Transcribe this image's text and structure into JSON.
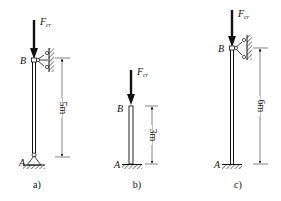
{
  "diagrams": [
    {
      "id": "a",
      "caption": "a)",
      "load_label": "F",
      "load_subscript": "cr",
      "top_point": "B",
      "bottom_point": "A",
      "length_label": "5m",
      "top_support": "lateral pin (wall)",
      "bottom_support": "pin"
    },
    {
      "id": "b",
      "caption": "b)",
      "load_label": "F",
      "load_subscript": "cr",
      "top_point": "B",
      "bottom_point": "A",
      "length_label": "3m",
      "top_support": "free",
      "bottom_support": "fixed"
    },
    {
      "id": "c",
      "caption": "c)",
      "load_label": "F",
      "load_subscript": "cr",
      "top_point": "B",
      "bottom_point": "A",
      "length_label": "6m",
      "top_support": "lateral pin (wall)",
      "bottom_support": "fixed"
    }
  ],
  "colors": {
    "ink": "#111111",
    "dim_line": "#333333"
  }
}
